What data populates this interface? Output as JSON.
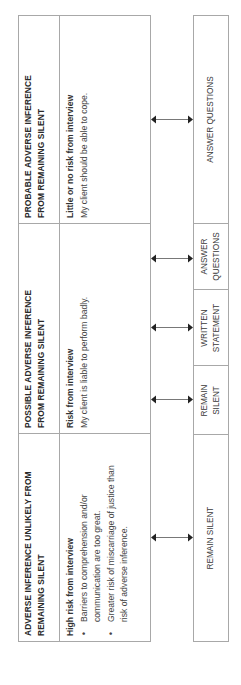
{
  "columns": [
    {
      "header": "ADVERSE INFERENCE UNLIKELY FROM REMAINING SILENT",
      "header_line1": "ADVERSE INFERENCE UNLIKELY FROM",
      "header_line2": "REMAINING SILENT",
      "risk_label": "High risk from interview",
      "bullets": [
        {
          "line1": "Barriers to comprehension and/or",
          "line2": "communication are too great."
        },
        {
          "line1": "Greater risk of miscarriage of justice than",
          "line2": "risk of adverse inference."
        }
      ]
    },
    {
      "header": "POSSIBLE ADVERSE INFERENCE FROM REMAINING SILENT",
      "header_line1": "POSSIBLE ADVERSE INFERENCE",
      "header_line2": "FROM REMAINING SILENT",
      "risk_label": "Risk from interview",
      "description": "My client is liable to perform badly."
    },
    {
      "header": "PROBABLE ADVERSE INFERENCE FROM REMAINING SILENT",
      "header_line1": "PROBABLE ADVERSE INFERENCE",
      "header_line2": "FROM REMAINING SILENT",
      "risk_label": "Little or no risk from interview",
      "description": "My client should be able to cope."
    }
  ],
  "options": {
    "unlikely": {
      "label": "REMAIN SILENT"
    },
    "possible": [
      {
        "line1": "REMAIN",
        "line2": "SILENT"
      },
      {
        "line1": "WRITTEN",
        "line2": "STATEMENT"
      },
      {
        "line1": "ANSWER",
        "line2": "QUESTIONS"
      }
    ],
    "probable": {
      "label": "ANSWER QUESTIONS"
    }
  },
  "colors": {
    "border": "#a8a8a8",
    "text": "#3a3a3a",
    "arrow": "#222222"
  }
}
